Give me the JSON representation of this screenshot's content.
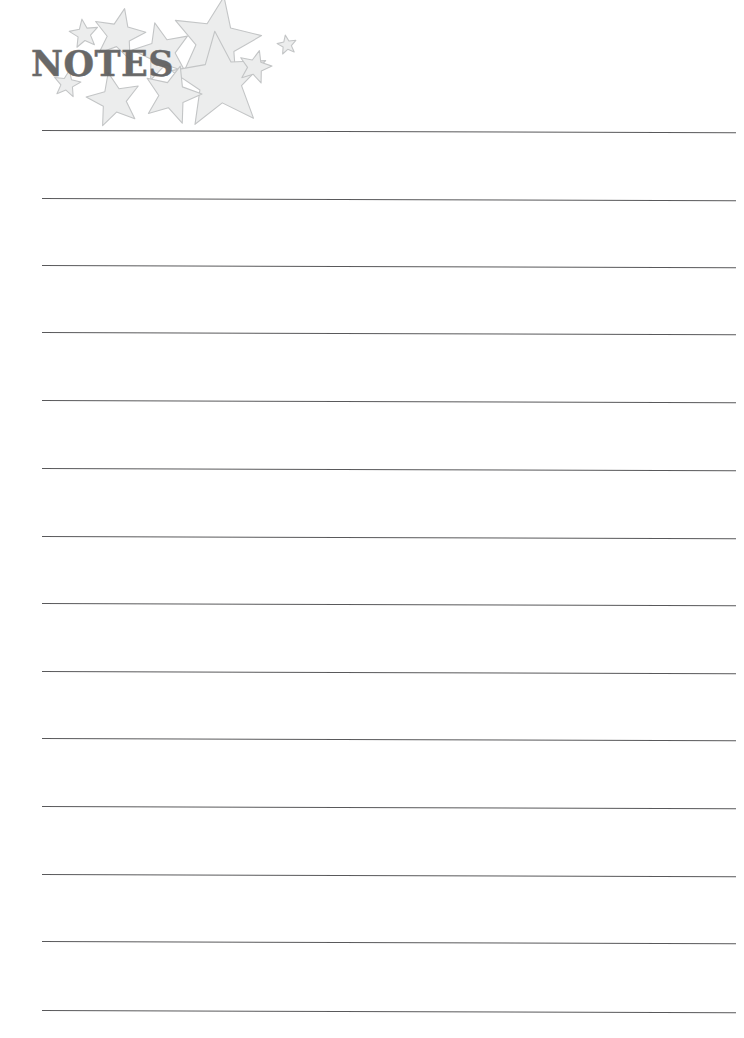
{
  "document": {
    "type": "printable-notes-page",
    "title": "NOTES",
    "background_color": "#ffffff"
  },
  "header": {
    "title": "NOTES",
    "title_color": "#5d5d5d",
    "title_left": 31,
    "title_top": 45,
    "title_size": 35
  },
  "decoration": {
    "motif": "star-cluster",
    "fill_color": "#eceded",
    "stroke_color": "#c3c5c6",
    "stars": [
      {
        "name": "star-small-1",
        "x": 84,
        "y": 34,
        "size": 15,
        "rotation": -8
      },
      {
        "name": "star-medium-1",
        "x": 119,
        "y": 35,
        "size": 27,
        "rotation": 12
      },
      {
        "name": "star-large-1",
        "x": 162,
        "y": 52,
        "size": 30,
        "rotation": -14
      },
      {
        "name": "star-xlarge-1",
        "x": 216,
        "y": 42,
        "size": 46,
        "rotation": 10
      },
      {
        "name": "star-xlarge-2",
        "x": 220,
        "y": 81,
        "size": 50,
        "rotation": -6
      },
      {
        "name": "star-small-2",
        "x": 255,
        "y": 67,
        "size": 17,
        "rotation": 15
      },
      {
        "name": "star-tiny-1",
        "x": 287,
        "y": 45,
        "size": 10,
        "rotation": -10
      },
      {
        "name": "star-small-3",
        "x": 67,
        "y": 84,
        "size": 14,
        "rotation": 10
      },
      {
        "name": "star-medium-2",
        "x": 114,
        "y": 100,
        "size": 28,
        "rotation": -12
      },
      {
        "name": "star-medium-3",
        "x": 172,
        "y": 95,
        "size": 30,
        "rotation": 16
      }
    ]
  },
  "ruled_area": {
    "line_color": "#4b4b4d",
    "line_thickness": 1.4,
    "left": 42,
    "right": 736,
    "tilt_degrees": 0.18,
    "line_count": 14,
    "lines": [
      {
        "name": "writing-line-1",
        "y": 130
      },
      {
        "name": "writing-line-2",
        "y": 198
      },
      {
        "name": "writing-line-3",
        "y": 265
      },
      {
        "name": "writing-line-4",
        "y": 332
      },
      {
        "name": "writing-line-5",
        "y": 400
      },
      {
        "name": "writing-line-6",
        "y": 468
      },
      {
        "name": "writing-line-7",
        "y": 536
      },
      {
        "name": "writing-line-8",
        "y": 603
      },
      {
        "name": "writing-line-9",
        "y": 671
      },
      {
        "name": "writing-line-10",
        "y": 738
      },
      {
        "name": "writing-line-11",
        "y": 806
      },
      {
        "name": "writing-line-12",
        "y": 874
      },
      {
        "name": "writing-line-13",
        "y": 941
      },
      {
        "name": "writing-line-14",
        "y": 1010
      }
    ]
  }
}
